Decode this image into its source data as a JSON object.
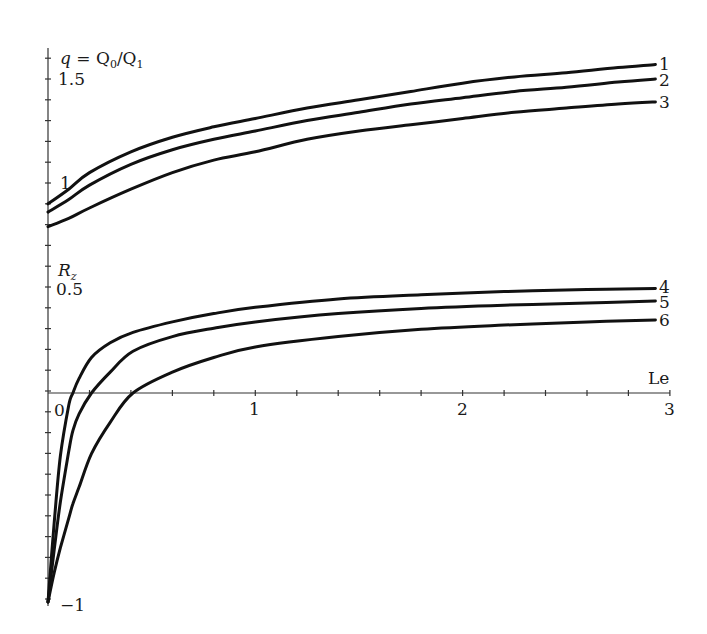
{
  "chart_data": [
    {
      "type": "line",
      "title": "",
      "ylabel": "q = Q0/Q1",
      "xlabel": "Le",
      "xlim": [
        0,
        3
      ],
      "ylim": [
        0.75,
        1.6
      ],
      "y_ticks_labeled": [
        "1",
        "1.5"
      ],
      "grid": false,
      "legend": "curve numbers at right end",
      "x": [
        0,
        0.1,
        0.2,
        0.4,
        0.6,
        0.8,
        1.0,
        1.25,
        1.5,
        1.75,
        2.0,
        2.25,
        2.5,
        2.75,
        2.93
      ],
      "series": [
        {
          "name": "1",
          "values": [
            0.9,
            0.97,
            1.05,
            1.15,
            1.22,
            1.27,
            1.31,
            1.36,
            1.4,
            1.44,
            1.48,
            1.51,
            1.53,
            1.555,
            1.57
          ]
        },
        {
          "name": "2",
          "values": [
            0.86,
            0.92,
            0.99,
            1.09,
            1.16,
            1.21,
            1.25,
            1.3,
            1.34,
            1.38,
            1.41,
            1.44,
            1.46,
            1.485,
            1.5
          ]
        },
        {
          "name": "3",
          "values": [
            0.79,
            0.83,
            0.88,
            0.97,
            1.05,
            1.11,
            1.15,
            1.21,
            1.25,
            1.28,
            1.31,
            1.34,
            1.36,
            1.38,
            1.39
          ]
        }
      ]
    },
    {
      "type": "line",
      "title": "",
      "ylabel": "R_z",
      "xlabel": "Le",
      "xlim": [
        0,
        3
      ],
      "ylim": [
        -1,
        0.55
      ],
      "x_ticks_labeled": [
        "0",
        "1",
        "2",
        "3"
      ],
      "y_ticks_labeled": [
        "-1",
        "0",
        "0.5"
      ],
      "grid": false,
      "legend": "curve numbers at right end",
      "x": [
        0,
        0.03,
        0.06,
        0.1,
        0.12,
        0.15,
        0.21,
        0.3,
        0.41,
        0.6,
        0.8,
        1.0,
        1.4,
        1.8,
        2.2,
        2.6,
        2.93
      ],
      "series": [
        {
          "name": "4",
          "values": [
            -1.0,
            -0.62,
            -0.3,
            -0.06,
            0.0,
            0.07,
            0.17,
            0.24,
            0.29,
            0.34,
            0.38,
            0.41,
            0.45,
            0.47,
            0.485,
            0.495,
            0.5
          ]
        },
        {
          "name": "5",
          "values": [
            -1.0,
            -0.75,
            -0.52,
            -0.28,
            -0.18,
            -0.1,
            0.0,
            0.1,
            0.2,
            0.27,
            0.31,
            0.34,
            0.38,
            0.405,
            0.42,
            0.43,
            0.44
          ]
        },
        {
          "name": "6",
          "values": [
            -1.0,
            -0.86,
            -0.74,
            -0.6,
            -0.53,
            -0.45,
            -0.29,
            -0.14,
            0.0,
            0.1,
            0.17,
            0.22,
            0.27,
            0.305,
            0.325,
            0.34,
            0.35
          ]
        }
      ]
    }
  ],
  "labels": {
    "q_axis_label_q": "q",
    "q_axis_label_eq": " = Q",
    "q_axis_sub0": "0",
    "q_axis_slash": "/Q",
    "q_axis_sub1": "1",
    "q_tick_15": "1.5",
    "q_tick_1": "1",
    "rz_axis_label_R": "R",
    "rz_axis_sub": "z",
    "rz_tick_05": "0.5",
    "rz_tick_0": "0",
    "rz_tick_m1": "−1",
    "x_axis_label": "Le",
    "x_tick_1": "1",
    "x_tick_2": "2",
    "x_tick_3": "3",
    "curve_1": "1",
    "curve_2": "2",
    "curve_3": "3",
    "curve_4": "4",
    "curve_5": "5",
    "curve_6": "6"
  },
  "colors": {
    "curve": "#111111",
    "axis": "#333333",
    "background": "#ffffff"
  }
}
